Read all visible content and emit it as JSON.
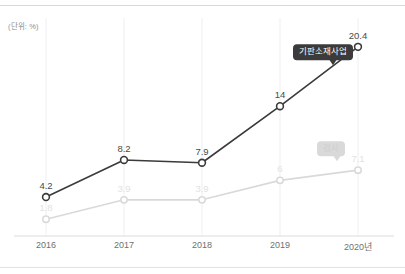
{
  "unit_label": "(단위: %)",
  "colors": {
    "dark_series": "#3b3b3b",
    "light_series": "#d9d9d9",
    "grid": "#efefef",
    "axis": "#dcdcdc",
    "tick_text": "#6f6f6f",
    "dark_label_text": "#4a4a4a",
    "light_label_text": "#e2e2e2"
  },
  "annotations": {
    "dark_callout": "기판소재사업",
    "light_callout": "검사"
  },
  "chart_data": {
    "type": "line",
    "title": "",
    "subtitle": "",
    "xlabel": "",
    "ylabel": "",
    "unit": "%",
    "categories": [
      "2016",
      "2017",
      "2018",
      "2019",
      "2020년"
    ],
    "x": [
      2016,
      2017,
      2018,
      2019,
      2020
    ],
    "ylim": [
      0,
      22
    ],
    "grid": "vertical-only",
    "legend": "inline-callouts",
    "series": [
      {
        "name": "기판소재사업",
        "color": "#3b3b3b",
        "marker": "open-circle",
        "values": [
          4.2,
          8.2,
          7.9,
          14,
          20.4
        ],
        "labels": [
          "4.2",
          "8.2",
          "7.9",
          "14",
          "20.4"
        ]
      },
      {
        "name": "검사",
        "color": "#d9d9d9",
        "marker": "open-circle",
        "values": [
          1.8,
          3.9,
          3.9,
          6,
          7.1
        ],
        "labels": [
          "1.8",
          "3.9",
          "3.9",
          "6",
          "7.1"
        ]
      }
    ]
  }
}
